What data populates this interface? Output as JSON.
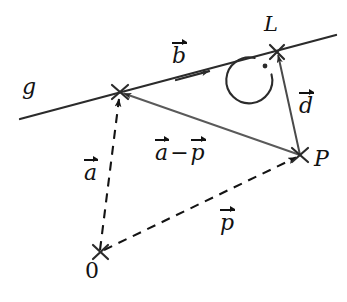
{
  "figure": {
    "background_color": "#ffffff",
    "stroke_color": "#2b2b2b",
    "text_color": "#121212",
    "width": 347,
    "height": 302,
    "labels": {
      "line_g": "g",
      "foot_point_L": "L",
      "point_P": "P",
      "origin": "0"
    },
    "vectors": {
      "b": {
        "symbol": "b",
        "has_arrow": true
      },
      "d": {
        "symbol": "d",
        "has_arrow": true
      },
      "a": {
        "symbol": "a",
        "has_arrow": true
      },
      "p": {
        "symbol": "p",
        "has_arrow": true
      },
      "a_minus_p": {
        "left": "a",
        "operator": "−",
        "right": "p",
        "has_arrow": true
      }
    },
    "points": {
      "A": {
        "x": 120,
        "y": 92,
        "marker": "cross"
      },
      "L": {
        "x": 277,
        "y": 52,
        "marker": "cross"
      },
      "P": {
        "x": 300,
        "y": 155,
        "marker": "cross"
      },
      "O": {
        "x": 100,
        "y": 252,
        "marker": "cross"
      }
    },
    "geometry": {
      "line_g": {
        "x1": 20,
        "y1": 119,
        "x2": 336,
        "y2": 35,
        "style": "solid"
      },
      "vector_b_arrow_tip": {
        "x": 210,
        "y": 71
      },
      "vector_d": {
        "from": "P",
        "to": "L",
        "style": "solid"
      },
      "vector_a": {
        "from": "O",
        "to": "A",
        "style": "dashed"
      },
      "vector_p": {
        "from": "O",
        "to": "P",
        "style": "dashed"
      },
      "vector_a_minus_p": {
        "from": "P",
        "to": "A",
        "style": "solid"
      },
      "right_angle_marker": {
        "at": "L",
        "type": "arc_with_dot",
        "radius": 23,
        "dot": {
          "x": 265,
          "y": 66
        }
      }
    }
  }
}
